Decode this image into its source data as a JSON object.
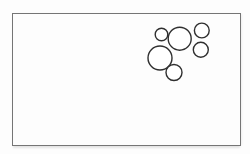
{
  "canvas": {
    "width": 250,
    "height": 154,
    "background": "#fdfdfd"
  },
  "frame": {
    "x": 12,
    "y": 13,
    "width": 229,
    "height": 133,
    "stroke": "#757575",
    "stroke_width": 1
  },
  "drawing": {
    "description": "Cluster of six overlapping hand-drawn circles in the upper-right region of the frame",
    "stroke": "#2f2f2f",
    "stroke_width": 1.4,
    "fill": "#ffffff",
    "circles": [
      {
        "name": "circle-large-lower-left",
        "cx": 160,
        "cy": 58,
        "r": 12
      },
      {
        "name": "circle-small-bottom",
        "cx": 174,
        "cy": 72.5,
        "r": 8
      },
      {
        "name": "circle-large-top-center",
        "cx": 179.7,
        "cy": 38.7,
        "r": 11.5
      },
      {
        "name": "circle-small-top-left",
        "cx": 161.5,
        "cy": 34.5,
        "r": 6.3
      },
      {
        "name": "circle-small-top-right",
        "cx": 201.8,
        "cy": 30.5,
        "r": 7.4
      },
      {
        "name": "circle-small-right-mid",
        "cx": 200.8,
        "cy": 49.8,
        "r": 7.5
      }
    ]
  }
}
